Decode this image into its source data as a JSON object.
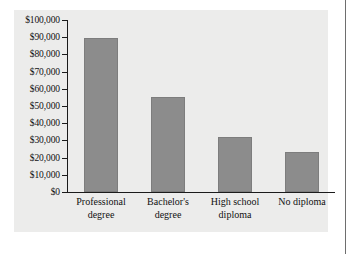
{
  "chart_data": {
    "type": "bar",
    "title": "",
    "subtitle": "",
    "xlabel": "",
    "ylabel": "",
    "categories": [
      "Professional degree",
      "Bachelor's degree",
      "High school diploma",
      "No diploma"
    ],
    "category_lines": [
      [
        "Professional",
        "degree"
      ],
      [
        "Bachelor's",
        "degree"
      ],
      [
        "High school",
        "diploma"
      ],
      [
        "No diploma",
        ""
      ]
    ],
    "values": [
      89500,
      55000,
      32000,
      23500
    ],
    "ylim": [
      0,
      100000
    ],
    "ytick_values": [
      0,
      10000,
      20000,
      30000,
      40000,
      50000,
      60000,
      70000,
      80000,
      90000,
      100000
    ],
    "ytick_labels": [
      "$0",
      "$10,000",
      "$20,000",
      "$30,000",
      "$40,000",
      "$50,000",
      "$60,000",
      "$70,000",
      "$80,000",
      "$90,000",
      "$100,000"
    ],
    "grid": false,
    "legend": null,
    "bar_color": "#8c8c8c",
    "bar_edge_color": "#7d7d7d",
    "axis_color": "#1b1b1b",
    "panel_color": "#ececeb",
    "figure_color": "#ffffff"
  }
}
